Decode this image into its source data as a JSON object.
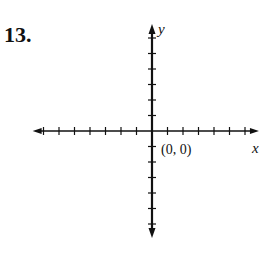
{
  "problem": {
    "number": "13."
  },
  "graph": {
    "x_axis_label": "x",
    "y_axis_label": "y",
    "origin_label": "(0, 0)",
    "axis_color": "#111111",
    "origin_px": [
      152,
      131
    ],
    "tick_spacing_px": 15.5,
    "x_ticks_negative": 7,
    "x_ticks_positive": 6,
    "y_ticks_positive": 6,
    "y_ticks_negative": 6
  },
  "chart_data": {
    "type": "scatter",
    "title": "",
    "xlabel": "x",
    "ylabel": "y",
    "x": [],
    "y": [],
    "annotations": [
      {
        "text": "(0, 0)",
        "x": 0,
        "y": 0
      }
    ],
    "xlim": [
      -7,
      6
    ],
    "ylim": [
      -6,
      6
    ],
    "grid": false
  }
}
